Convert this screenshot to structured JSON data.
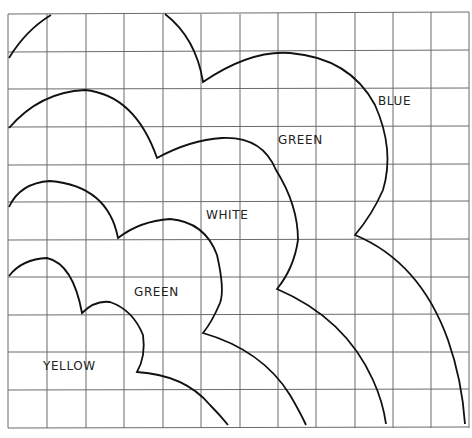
{
  "figure": {
    "grid": {
      "columns": 12,
      "rows": 11,
      "cell_size_px": 38.4,
      "origin": [
        8,
        14
      ],
      "line_color": "#555555"
    },
    "curve_color": "#111111",
    "labels": [
      {
        "id": "blue",
        "text": "BLUE",
        "x": 378,
        "y": 94
      },
      {
        "id": "green-outer",
        "text": "GREEN",
        "x": 278,
        "y": 133
      },
      {
        "id": "white",
        "text": "WHITE",
        "x": 206,
        "y": 208
      },
      {
        "id": "green-inner",
        "text": "GREEN",
        "x": 134,
        "y": 285
      },
      {
        "id": "yellow",
        "text": "YELLOW",
        "x": 43,
        "y": 359
      }
    ]
  }
}
